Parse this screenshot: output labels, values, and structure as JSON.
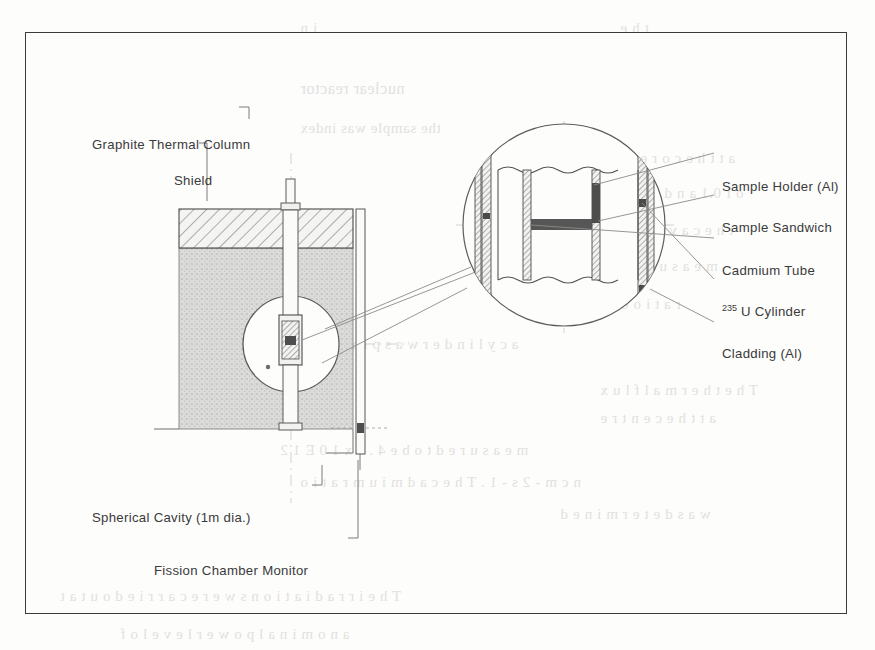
{
  "figure": {
    "kind": "engineering-cross-section"
  },
  "left_labels": [
    {
      "id": "graphite",
      "text": "Graphite Thermal Column"
    },
    {
      "id": "shield",
      "text": "Shield"
    },
    {
      "id": "cavity",
      "text": "Spherical Cavity (1m dia.)"
    },
    {
      "id": "fission",
      "text": "Fission Chamber Monitor"
    }
  ],
  "right_labels": [
    {
      "id": "holder",
      "text": "Sample Holder (Al)",
      "sup": ""
    },
    {
      "id": "sandwich",
      "text": "Sample Sandwich",
      "sup": ""
    },
    {
      "id": "cadmium",
      "text": "Cadmium Tube",
      "sup": ""
    },
    {
      "id": "uranium",
      "text": " U Cylinder",
      "sup": "235"
    },
    {
      "id": "cladding",
      "text": "Cladding (Al)",
      "sup": ""
    }
  ],
  "colors": {
    "ink": "#3a3a3a",
    "frame": "#3b3b3b",
    "graphite_fill": "#d4d4d2",
    "shield_hatch": "#6f6f6f",
    "paper": "#fdfdfc",
    "ghost": "#b9b6b2",
    "sample_dark": "#5c5c5c"
  },
  "ghost_text": [
    {
      "text": "nuclear  reactor",
      "x": 300,
      "y": 80,
      "size": 16
    },
    {
      "text": "the  sample  was  index",
      "x": 300,
      "y": 120,
      "size": 15
    },
    {
      "text": "a t   t h e   c o r e",
      "x": 640,
      "y": 150,
      "size": 15
    },
    {
      "text": "o f   0.1  a n d   f l u x",
      "x": 620,
      "y": 185,
      "size": 15
    },
    {
      "text": "t h e   c a v i t y  w a s",
      "x": 600,
      "y": 222,
      "size": 15
    },
    {
      "text": "m e a s u r e d   b y",
      "x": 600,
      "y": 258,
      "size": 15
    },
    {
      "text": "r a t i o   0 0",
      "x": 608,
      "y": 296,
      "size": 15
    },
    {
      "text": "a   c y l i n d e r   w a s   p l a c e d   i n s i d e",
      "x": 250,
      "y": 336,
      "size": 15
    },
    {
      "text": "T h e   t h e r m a l   f l u x",
      "x": 600,
      "y": 382,
      "size": 15
    },
    {
      "text": "a t   t h e   c e n t r e",
      "x": 600,
      "y": 410,
      "size": 15
    },
    {
      "text": "m e a s u r e d    t o   b e   4 . 6   x   1 0 E 1 2",
      "x": 280,
      "y": 442,
      "size": 15
    },
    {
      "text": "n   c m - 2   s - 1   .   T h e    c a d m i u m    r a t i o",
      "x": 300,
      "y": 474,
      "size": 15
    },
    {
      "text": "w a s   d e t e r m i n e d",
      "x": 560,
      "y": 506,
      "size": 15
    },
    {
      "text": "T h e   i r r a d i a t i o n s   w e r e   c a r r i e d   o u t   a t",
      "x": 60,
      "y": 588,
      "size": 15
    },
    {
      "text": "a   n o m i n a l   p o w e r   l e v e l   o f",
      "x": 120,
      "y": 626,
      "size": 15
    },
    {
      "text": "i n",
      "x": 300,
      "y": 20,
      "size": 15
    },
    {
      "text": "t h e",
      "x": 620,
      "y": 20,
      "size": 15
    }
  ]
}
